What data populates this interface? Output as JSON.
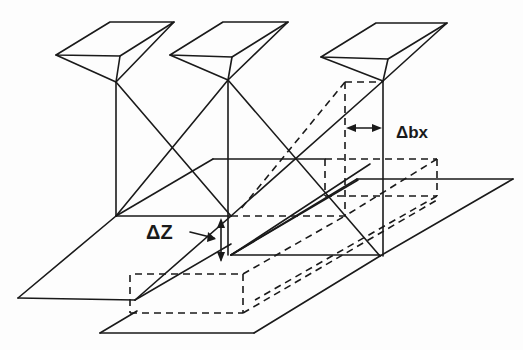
{
  "diagram": {
    "type": "stereo-parallax-geometry",
    "labels": {
      "delta_z": "ΔZ",
      "delta_bx": "Δbx"
    },
    "elements": {
      "cameras": [
        "camera-1",
        "camera-2",
        "camera-3"
      ],
      "surfaces": [
        "upper-ground-plane",
        "lower-ground-plane"
      ],
      "dashed": [
        "displaced-camera-outline",
        "displaced-plane-box"
      ]
    },
    "colors": {
      "ink": "#1a1a1a",
      "background": "#fdfdfd"
    }
  }
}
